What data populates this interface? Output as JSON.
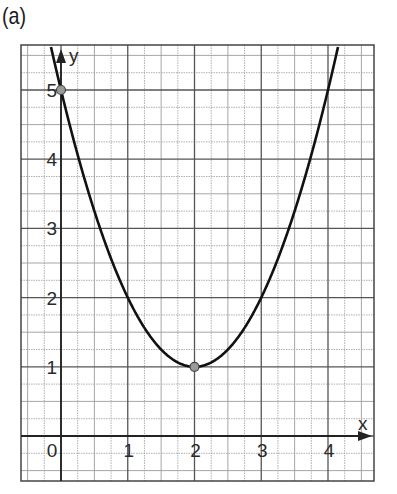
{
  "panel_label": "(a)",
  "chart_data": {
    "type": "line",
    "title": "",
    "xlabel": "x",
    "ylabel": "y",
    "function": "y = (x - 2)^2 + 1",
    "xlim": [
      -0.6,
      4.7
    ],
    "ylim": [
      -0.65,
      5.65
    ],
    "x_ticks": [
      0,
      1,
      2,
      3,
      4
    ],
    "y_ticks": [
      1,
      2,
      3,
      4,
      5
    ],
    "x_tick_labels": [
      "0",
      "1",
      "2",
      "3",
      "4"
    ],
    "y_tick_labels": [
      "1",
      "2",
      "3",
      "4",
      "5"
    ],
    "grid": true,
    "minor_grid_step": 0.25,
    "series": [
      {
        "name": "parabola",
        "x": [
          -0.3,
          0,
          0.5,
          1,
          1.5,
          2,
          2.5,
          3,
          3.5,
          4,
          4.15
        ],
        "values": [
          6.29,
          5,
          3.25,
          2,
          1.25,
          1,
          1.25,
          2,
          3.25,
          5,
          5.62
        ]
      }
    ],
    "marked_points": [
      {
        "x": 0,
        "y": 5,
        "label": "y-intercept"
      },
      {
        "x": 2,
        "y": 1,
        "label": "vertex"
      }
    ],
    "colors": {
      "curve": "#111111",
      "grid_major": "#555555",
      "grid_minor": "#aaaaaa",
      "point_fill": "#9a9a9a"
    }
  }
}
